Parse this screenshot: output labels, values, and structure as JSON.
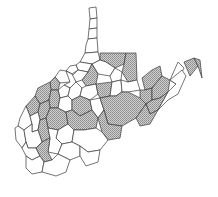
{
  "map": {
    "title": "West Virginia counties",
    "region": "West Virginia",
    "legend": [],
    "colors": {
      "border": "#3a3a3a",
      "hatch_fill": "#c8c8c8",
      "hatch_line": "#7a7a7a",
      "background": "#ffffff",
      "plain_fill": "#ffffff"
    },
    "counties": [
      {
        "id": "hancock",
        "hatched": false,
        "points": "89,8 96,7 97,18 90,19"
      },
      {
        "id": "brooke",
        "hatched": false,
        "points": "90,19 97,18 97,28 89,29"
      },
      {
        "id": "ohio",
        "hatched": false,
        "points": "89,29 97,28 97,38 88,39"
      },
      {
        "id": "marshall",
        "hatched": false,
        "points": "88,39 97,38 98,52 85,53 86,45"
      },
      {
        "id": "wetzel",
        "hatched": false,
        "points": "85,53 98,52 100,60 92,64 80,62"
      },
      {
        "id": "tyler",
        "hatched": false,
        "points": "80,62 92,64 88,72 78,70 76,65"
      },
      {
        "id": "pleasants",
        "hatched": false,
        "points": "70,66 76,65 78,70 72,74 66,71"
      },
      {
        "id": "wood",
        "hatched": false,
        "points": "60,70 66,71 72,74 70,82 60,83 55,77"
      },
      {
        "id": "monongalia",
        "hatched": true,
        "points": "100,53 126,53 124,64 115,68 106,62 100,60"
      },
      {
        "id": "preston",
        "hatched": true,
        "points": "126,53 136,53 137,80 128,82 122,72 124,64"
      },
      {
        "id": "marion",
        "hatched": false,
        "points": "100,60 106,62 115,68 110,76 98,74 92,64"
      },
      {
        "id": "harrison",
        "hatched": true,
        "points": "88,72 92,64 98,74 96,84 86,86 82,80"
      },
      {
        "id": "taylor",
        "hatched": false,
        "points": "110,76 115,68 122,72 121,80 112,82"
      },
      {
        "id": "doddridge",
        "hatched": false,
        "points": "78,70 88,72 82,80 76,82 72,76"
      },
      {
        "id": "ritchie",
        "hatched": false,
        "points": "66,71 72,74 76,82 70,88 64,85 70,82"
      },
      {
        "id": "wirt",
        "hatched": true,
        "points": "55,77 60,83 58,90 51,90 50,82"
      },
      {
        "id": "jackson",
        "hatched": true,
        "points": "38,88 50,82 51,90 49,100 40,104 35,96"
      },
      {
        "id": "calhoun",
        "hatched": false,
        "points": "58,90 64,85 70,88 68,96 60,98"
      },
      {
        "id": "roane",
        "hatched": true,
        "points": "49,100 51,90 58,90 60,98 58,108 50,108"
      },
      {
        "id": "gilmer",
        "hatched": false,
        "points": "68,96 70,88 76,82 82,88 80,96 72,100"
      },
      {
        "id": "lewis",
        "hatched": false,
        "points": "82,88 86,86 96,84 98,94 90,100 80,96"
      },
      {
        "id": "upshur",
        "hatched": true,
        "points": "96,84 112,82 110,96 100,98 98,94"
      },
      {
        "id": "barbour",
        "hatched": false,
        "points": "112,82 121,80 122,92 116,96 110,96"
      },
      {
        "id": "tucker",
        "hatched": false,
        "points": "121,80 128,82 137,80 140,90 128,92 122,92"
      },
      {
        "id": "mineral",
        "hatched": true,
        "points": "142,78 152,70 160,66 162,76 152,88 145,90"
      },
      {
        "id": "grant",
        "hatched": true,
        "points": "140,90 145,90 152,88 152,100 146,104 140,98"
      },
      {
        "id": "hampshire",
        "hatched": true,
        "points": "152,88 162,76 170,80 168,92 160,98 152,100"
      },
      {
        "id": "hardy",
        "hatched": true,
        "points": "146,104 152,100 160,98 168,92 158,110 150,114"
      },
      {
        "id": "morgan",
        "hatched": false,
        "points": "170,80 178,62 184,68 176,84"
      },
      {
        "id": "berkeley",
        "hatched": true,
        "points": "184,62 194,58 198,66 190,76"
      },
      {
        "id": "jefferson",
        "hatched": true,
        "points": "194,58 200,60 202,78 198,66"
      },
      {
        "id": "mason",
        "hatched": true,
        "points": "35,96 40,104 38,112 30,116 26,106"
      },
      {
        "id": "putnam",
        "hatched": true,
        "points": "38,112 40,104 49,100 50,108 46,118 40,120"
      },
      {
        "id": "kanawha",
        "hatched": true,
        "points": "46,118 50,108 58,108 66,112 68,124 58,130 48,128"
      },
      {
        "id": "clay",
        "hatched": false,
        "points": "58,108 60,98 68,96 72,100 72,110 66,112"
      },
      {
        "id": "braxton",
        "hatched": true,
        "points": "72,100 80,96 90,100 92,110 80,116 72,110"
      },
      {
        "id": "webster",
        "hatched": false,
        "points": "90,100 100,98 104,110 98,118 92,110"
      },
      {
        "id": "randolph",
        "hatched": true,
        "points": "110,96 116,96 122,92 128,92 140,98 146,104 136,118 122,126 108,124 104,110 100,98"
      },
      {
        "id": "pendleton",
        "hatched": true,
        "points": "136,118 146,104 150,114 158,110 150,124 140,126"
      },
      {
        "id": "nicholas",
        "hatched": true,
        "points": "68,124 66,112 72,110 80,116 92,110 98,118 96,128 84,130 74,130"
      },
      {
        "id": "pocahontas",
        "hatched": true,
        "points": "98,118 104,110 108,124 122,126 120,138 108,140 102,132"
      },
      {
        "id": "cabell",
        "hatched": false,
        "points": "20,118 26,106 30,116 32,124 24,130 18,126"
      },
      {
        "id": "wayne",
        "hatched": false,
        "points": "15,128 18,126 24,130 26,142 22,148 16,140"
      },
      {
        "id": "lincoln",
        "hatched": false,
        "points": "30,116 38,112 40,120 38,130 32,132 32,124"
      },
      {
        "id": "boone",
        "hatched": true,
        "points": "38,130 40,120 46,118 48,128 50,138 42,142"
      },
      {
        "id": "logan",
        "hatched": false,
        "points": "26,142 24,130 32,124 32,132 38,130 42,142 36,148 28,148"
      },
      {
        "id": "mingo",
        "hatched": false,
        "points": "22,148 26,142 28,148 36,148 40,156 32,160 26,156"
      },
      {
        "id": "fayette",
        "hatched": false,
        "points": "58,130 68,124 74,130 72,142 62,144 56,138"
      },
      {
        "id": "raleigh",
        "hatched": false,
        "points": "50,138 48,128 58,130 56,138 62,144 58,154 48,152"
      },
      {
        "id": "greenbrier",
        "hatched": false,
        "points": "74,130 84,130 96,128 102,132 108,140 100,150 88,152 80,146 72,142"
      },
      {
        "id": "wyoming",
        "hatched": true,
        "points": "36,148 42,142 50,138 48,152 52,160 44,162 40,156"
      },
      {
        "id": "summers",
        "hatched": false,
        "points": "62,144 72,142 80,146 80,156 70,160 58,154"
      },
      {
        "id": "monroe",
        "hatched": false,
        "points": "80,146 88,152 100,150 98,162 86,166 80,156"
      },
      {
        "id": "mcdowell",
        "hatched": false,
        "points": "26,156 32,160 40,156 44,162 42,172 32,174 26,168"
      },
      {
        "id": "mercer",
        "hatched": false,
        "points": "44,162 52,160 58,154 70,160 66,172 56,176 42,172"
      },
      {
        "id": "extra-east",
        "hatched": false,
        "points": "168,92 176,84 170,80 182,70 186,76 178,94 168,100 158,110"
      }
    ]
  }
}
